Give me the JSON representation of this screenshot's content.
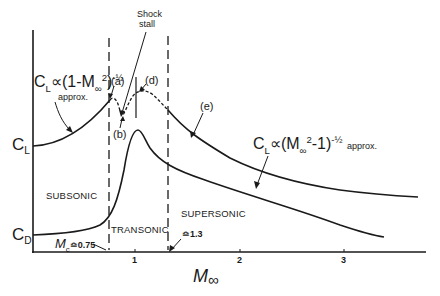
{
  "figure": {
    "axes": {
      "y_labels": {
        "cl": "C",
        "cl_sub": "L",
        "cd": "C",
        "cd_sub": "D"
      },
      "x_label": {
        "main": "M",
        "sub": "∞"
      },
      "x_ticks": [
        "1",
        "2",
        "3"
      ]
    },
    "regions": {
      "subsonic": "SUBSONIC",
      "transonic": "TRANSONIC",
      "supersonic": "SUPERSONIC"
    },
    "boundaries": {
      "mc_label": "M",
      "mc_sub": "c",
      "mc_value": "≏0.75",
      "upper_value": "≏1.3"
    },
    "annotations": {
      "shock_stall_line1": "Shock",
      "shock_stall_line2": "stall",
      "a": "(a)",
      "b": "(b)",
      "d": "(d)",
      "e": "(e)",
      "subsonic_formula": "C",
      "subsonic_formula_sub": "L",
      "subsonic_formula_rest": "∝(1-M",
      "subsonic_formula_inf": "∞",
      "subsonic_formula_exp2": "2",
      "subsonic_formula_close": ")",
      "subsonic_formula_pow": "-½",
      "subsonic_approx": "approx.",
      "supersonic_formula": "C",
      "supersonic_formula_sub": "L",
      "supersonic_formula_rest": "∝(M",
      "supersonic_formula_inf": "∞",
      "supersonic_formula_exp2": "2",
      "supersonic_formula_close": "-1)",
      "supersonic_formula_pow": "-½",
      "supersonic_approx": "approx."
    },
    "curves": {
      "lift": "C_L vs M∞: rises subsonically, peak (a) near M≈0.75, dip (b) shock stall, rises to (d) near M≈1.05, decays supersonically (e)",
      "drag": "C_D vs M∞: flat subsonic, sharp rise after M_c≈0.75, peak ≈M 1.0-1.1, decays supersonically"
    },
    "colors": {
      "ink": "#1a1a1a",
      "background": "#ffffff"
    }
  }
}
